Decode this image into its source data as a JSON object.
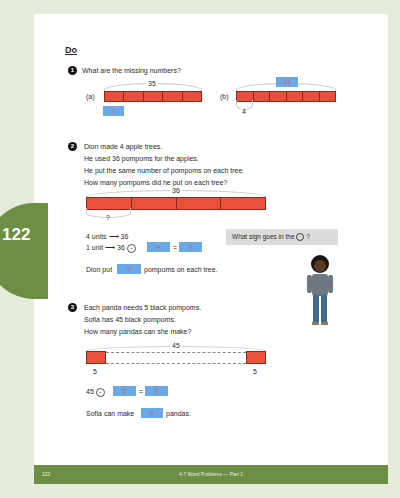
{
  "page": {
    "number": "122",
    "footer_chapter": "4-7  Word Problems — Part 1",
    "accent_color": "#6d8f43"
  },
  "section": {
    "heading": "Do"
  },
  "q1": {
    "num": "1",
    "prompt": "What are the missing numbers?",
    "a": {
      "label": "(a)",
      "total": "35",
      "segments": 5,
      "answer": "7"
    },
    "b": {
      "label": "(b)",
      "total": "24",
      "segments": 6,
      "part": "4"
    }
  },
  "q2": {
    "num": "2",
    "lines": [
      "Dion made 4 apple trees.",
      "He used 36 pompoms for the apples.",
      "He put the same number of pompoms on each tree.",
      "How many pompoms did he put on each tree?"
    ],
    "bar_total": "36",
    "segments": 4,
    "unknown": "?",
    "step1": "4 units ⟶ 36",
    "step2_prefix": "1 unit ⟶ 36",
    "sign": "÷",
    "divisor": "4",
    "equals": "=",
    "result": "9",
    "answer_prefix": "Dion put",
    "answer_value": "9",
    "answer_suffix": "pompoms on each tree.",
    "bubble": {
      "prefix": "What sign goes in the",
      "suffix": "?"
    }
  },
  "q3": {
    "num": "3",
    "lines": [
      "Each panda needs 5 black pompoms.",
      "Sofia has 45 black pompoms.",
      "How many pandas can she make?"
    ],
    "bar_total": "45",
    "left_part": "5",
    "right_part": "5",
    "eq_left": "45",
    "sign": "÷",
    "divisor": "5",
    "equals": "=",
    "result": "9",
    "answer_prefix": "Sofia can make",
    "answer_value": "9",
    "answer_suffix": "pandas."
  }
}
